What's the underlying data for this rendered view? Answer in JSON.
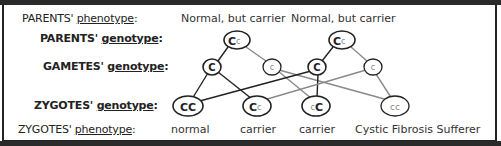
{
  "row_labels": {
    "parents_phenotype": {
      "prefix": "PARENTS'",
      "underlined": "phenotype",
      "suffix": ":"
    },
    "parents_genotype": {
      "prefix": "PARENTS'",
      "underlined": "genotype",
      "suffix": ":"
    },
    "gametes_genotype": {
      "prefix": "GAMETES'",
      "underlined": "genotype",
      "suffix": ":"
    },
    "zygotes_genotype": {
      "prefix": "ZYGOTES'",
      "underlined": "genotype",
      "suffix": ":"
    },
    "zygotes_phenotype": {
      "prefix": "ZYGOTES'",
      "underlined": "phenotype",
      "suffix": ":"
    }
  },
  "parents": [
    {
      "phenotype": "Normal, but carrier",
      "genotype": {
        "dominant": "C",
        "recessive": "c"
      }
    },
    {
      "phenotype": "Normal, but carrier",
      "genotype": {
        "dominant": "C",
        "recessive": "c"
      }
    }
  ],
  "gametes": [
    {
      "allele": "C",
      "type": "dominant"
    },
    {
      "allele": "c",
      "type": "recessive"
    },
    {
      "allele": "C",
      "type": "dominant"
    },
    {
      "allele": "c",
      "type": "recessive"
    }
  ],
  "zygotes": [
    {
      "first": "C",
      "second": "C",
      "phenotype": "normal"
    },
    {
      "first": "C",
      "second": "c",
      "phenotype": "carrier"
    },
    {
      "first": "c",
      "second": "C",
      "phenotype": "carrier"
    },
    {
      "first": "c",
      "second": "c",
      "phenotype": "Cystic Fibrosis Sufferer"
    }
  ],
  "colors": {
    "dominant": "#222222",
    "recessive": "#8a8a8a",
    "border": "#222222"
  }
}
